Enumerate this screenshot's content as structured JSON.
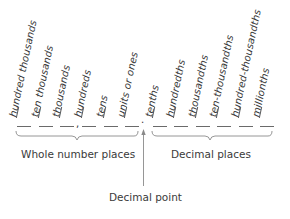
{
  "diagram": {
    "whole_columns": [
      {
        "label": "hundred thousands"
      },
      {
        "label": "ten thousands"
      },
      {
        "label": "thousands"
      },
      {
        "label": "hundreds"
      },
      {
        "label": "tens"
      },
      {
        "label": "units or ones"
      }
    ],
    "decimal_columns": [
      {
        "label": "tenths"
      },
      {
        "label": "hundredths"
      },
      {
        "label": "thousandths"
      },
      {
        "label": "ten-thousandths"
      },
      {
        "label": "hundred-thousandths"
      },
      {
        "label": "millionths"
      }
    ],
    "thousands_separator": ",",
    "decimal_point_symbol": ".",
    "whole_group_label": "Whole number places",
    "decimal_group_label": "Decimal places",
    "decimal_point_label": "Decimal point",
    "colors": {
      "text": "#3a3a3a",
      "lines": "#8a8a8a"
    }
  }
}
